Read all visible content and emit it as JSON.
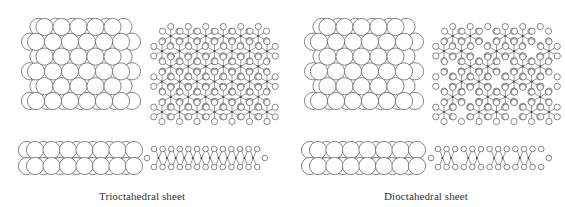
{
  "figure": {
    "panels": [
      {
        "id": "trioctahedral",
        "caption": "Trioctahedral sheet",
        "caption_x": 142,
        "caption_y": 190,
        "top_packing": {
          "x0": 28,
          "y0": 18,
          "cols": 6,
          "rows": 6,
          "r": 8.6,
          "dx": 17,
          "dy": 14.8
        },
        "network": {
          "x0": 150,
          "y0": 28,
          "cols": 7,
          "rows": 6,
          "dioctahedral": false
        },
        "side_packing": {
          "x0": 24,
          "y0": 141,
          "cols": 7,
          "r": 8.6
        },
        "side_network": {
          "x0": 150,
          "y0": 146,
          "count": 13,
          "dioctahedral": false
        }
      },
      {
        "id": "dioctahedral",
        "caption": "Dioctahedral sheet",
        "caption_x": 426,
        "caption_y": 190,
        "top_packing": {
          "x0": 311,
          "y0": 18,
          "cols": 6,
          "rows": 6,
          "r": 8.6,
          "dx": 17,
          "dy": 14.8
        },
        "network": {
          "x0": 432,
          "y0": 28,
          "cols": 7,
          "rows": 6,
          "dioctahedral": true
        },
        "side_packing": {
          "x0": 307,
          "y0": 141,
          "cols": 7,
          "r": 8.6
        },
        "side_network": {
          "x0": 434,
          "y0": 146,
          "count": 13,
          "dioctahedral": true
        }
      }
    ],
    "colors": {
      "stroke": "#6a6a6a",
      "node": "#4a4a4a",
      "background": "#ffffff",
      "text": "#333333"
    }
  }
}
